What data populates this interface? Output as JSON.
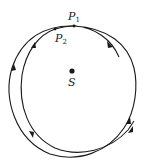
{
  "diagram": {
    "title": "",
    "colors": {
      "ink": "#1a1a1a",
      "background": "#ffffff"
    },
    "focus": {
      "label": "S",
      "x": 72,
      "y": 71
    },
    "points": [
      {
        "id": "P1",
        "label": "P",
        "subscript": "1",
        "x": 74,
        "y": 26,
        "label_x": 66,
        "label_y": 20
      },
      {
        "id": "P2",
        "label": "P",
        "subscript": "2",
        "x": 55,
        "y": 29,
        "label_x": 55,
        "label_y": 42
      }
    ],
    "orbits": [
      {
        "name": "outer-orbit",
        "description": "precessing orbit path, outer loop"
      },
      {
        "name": "inner-orbit",
        "description": "precessing orbit path, inner loop"
      }
    ],
    "arrows": [
      {
        "name": "arrow-top-right",
        "x": 110,
        "y": 45,
        "direction": "clockwise"
      },
      {
        "name": "arrow-left-outer",
        "x": 14,
        "y": 68,
        "direction": "up"
      },
      {
        "name": "arrow-top-left-inner",
        "x": 34,
        "y": 45,
        "direction": "up"
      },
      {
        "name": "arrow-bottom-left-inner",
        "x": 32,
        "y": 135,
        "direction": "down"
      },
      {
        "name": "arrow-right-outer",
        "x": 129,
        "y": 122,
        "direction": "up"
      },
      {
        "name": "arrow-right-tail",
        "x": 131,
        "y": 131,
        "direction": "up"
      }
    ]
  }
}
